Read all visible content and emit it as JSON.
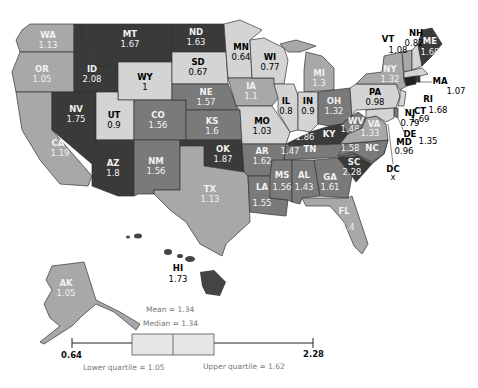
{
  "map": {
    "colors": {
      "very_dark": "#3a3a3a",
      "dark": "#555555",
      "mid": "#7a7a7a",
      "light": "#a8a8a8",
      "pale": "#d4d4d4"
    },
    "states": {
      "WA": {
        "abbr": "WA",
        "value": "1.13"
      },
      "OR": {
        "abbr": "OR",
        "value": "1.05"
      },
      "CA": {
        "abbr": "CA",
        "value": "1.19"
      },
      "ID": {
        "abbr": "ID",
        "value": "2.08"
      },
      "NV": {
        "abbr": "NV",
        "value": "1.75"
      },
      "MT": {
        "abbr": "MT",
        "value": "1.67"
      },
      "WY": {
        "abbr": "WY",
        "value": "1"
      },
      "UT": {
        "abbr": "UT",
        "value": "0.9"
      },
      "AZ": {
        "abbr": "AZ",
        "value": "1.8"
      },
      "CO": {
        "abbr": "CO",
        "value": "1.56"
      },
      "NM": {
        "abbr": "NM",
        "value": "1.56"
      },
      "ND": {
        "abbr": "ND",
        "value": "1.63"
      },
      "SD": {
        "abbr": "SD",
        "value": "0.67"
      },
      "NE": {
        "abbr": "NE",
        "value": "1.57"
      },
      "KS": {
        "abbr": "KS",
        "value": "1.6"
      },
      "OK": {
        "abbr": "OK",
        "value": "1.87"
      },
      "TX": {
        "abbr": "TX",
        "value": "1.13"
      },
      "MN": {
        "abbr": "MN",
        "value": "0.64"
      },
      "IA": {
        "abbr": "IA",
        "value": "1.1"
      },
      "MO": {
        "abbr": "MO",
        "value": "1.03"
      },
      "AR": {
        "abbr": "AR",
        "value": "1.62"
      },
      "LA": {
        "abbr": "LA",
        "value": "1.55"
      },
      "WI": {
        "abbr": "WI",
        "value": "0.77"
      },
      "IL": {
        "abbr": "IL",
        "value": "0.8"
      },
      "MI": {
        "abbr": "MI",
        "value": "1.3"
      },
      "IN": {
        "abbr": "IN",
        "value": "0.9"
      },
      "OH": {
        "abbr": "OH",
        "value": "1.32"
      },
      "KY": {
        "abbr": "KY",
        "value": "1.86"
      },
      "TN": {
        "abbr": "TN",
        "value": "1.47"
      },
      "MS": {
        "abbr": "MS",
        "value": "1.56"
      },
      "AL": {
        "abbr": "AL",
        "value": "1.43"
      },
      "GA": {
        "abbr": "GA",
        "value": "1.61"
      },
      "FL": {
        "abbr": "FL",
        "value": "1.4"
      },
      "SC": {
        "abbr": "SC",
        "value": "2.28"
      },
      "NC": {
        "abbr": "NC",
        "value": "1.58"
      },
      "VA": {
        "abbr": "VA",
        "value": "1.33"
      },
      "WV": {
        "abbr": "WV",
        "value": "1.48"
      },
      "PA": {
        "abbr": "PA",
        "value": "0.98"
      },
      "NY": {
        "abbr": "NY",
        "value": "1.32"
      },
      "VT": {
        "abbr": "VT",
        "value": "1.08"
      },
      "NH": {
        "abbr": "NH",
        "value": "0.82"
      },
      "ME": {
        "abbr": "ME",
        "value": "1.68"
      },
      "MA": {
        "abbr": "MA",
        "value": "1.07"
      },
      "RI": {
        "abbr": "RI",
        "value": "1.68"
      },
      "CT": {
        "abbr": "CT",
        "value": "1.69"
      },
      "NJ": {
        "abbr": "NJ",
        "value": "0.79"
      },
      "DE": {
        "abbr": "DE",
        "value": "1.35"
      },
      "MD": {
        "abbr": "MD",
        "value": "0.96"
      },
      "DC": {
        "abbr": "DC",
        "value": "x"
      },
      "AK": {
        "abbr": "AK",
        "value": "1.05"
      },
      "HI": {
        "abbr": "HI",
        "value": "1.73"
      }
    }
  },
  "boxplot": {
    "mean_label": "Mean = 1.34",
    "median_label": "Median = 1.34",
    "min_label": "0.64",
    "max_label": "2.28",
    "lower_quartile_label": "Lower quartile = 1.05",
    "upper_quartile_label": "Upper quartile = 1.62",
    "min": 0.64,
    "q1": 1.05,
    "median": 1.34,
    "q3": 1.62,
    "max": 2.28,
    "mean": 1.34
  }
}
